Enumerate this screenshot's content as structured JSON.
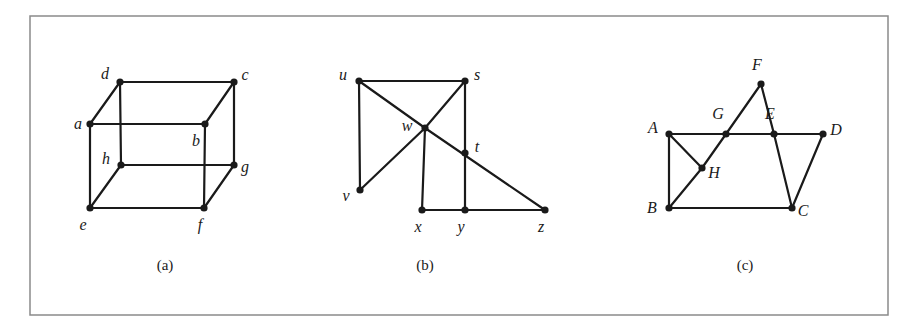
{
  "figure": {
    "background_color": "#ffffff",
    "border_color": "#8a8a8a",
    "edge_color": "#1a1a1a",
    "vertex_color": "#1a1a1a",
    "label_color": "#1a1a1a",
    "border": {
      "x": 30,
      "y": 16,
      "width": 858,
      "height": 299
    },
    "panels": [
      {
        "id": "a",
        "caption": "(a)",
        "caption_pos": {
          "x": 165,
          "y": 270
        },
        "vertices": [
          {
            "id": "a",
            "label": "a",
            "x": 90,
            "y": 124,
            "lx": 78,
            "ly": 129
          },
          {
            "id": "b",
            "label": "b",
            "x": 205,
            "y": 124,
            "lx": 196,
            "ly": 146
          },
          {
            "id": "c",
            "label": "c",
            "x": 234,
            "y": 82,
            "lx": 245,
            "ly": 80
          },
          {
            "id": "d",
            "label": "d",
            "x": 120,
            "y": 82,
            "lx": 105,
            "ly": 79
          },
          {
            "id": "e",
            "label": "e",
            "x": 90,
            "y": 208,
            "lx": 83,
            "ly": 230
          },
          {
            "id": "f",
            "label": "f",
            "x": 204,
            "y": 208,
            "lx": 200,
            "ly": 230
          },
          {
            "id": "g",
            "label": "g",
            "x": 234,
            "y": 165,
            "lx": 245,
            "ly": 172
          },
          {
            "id": "h",
            "label": "h",
            "x": 121,
            "y": 165,
            "lx": 106,
            "ly": 164
          }
        ],
        "edges": [
          [
            "d",
            "c"
          ],
          [
            "a",
            "b"
          ],
          [
            "h",
            "g"
          ],
          [
            "e",
            "f"
          ],
          [
            "a",
            "d"
          ],
          [
            "b",
            "c"
          ],
          [
            "e",
            "h"
          ],
          [
            "f",
            "g"
          ],
          [
            "d",
            "h"
          ],
          [
            "c",
            "g"
          ],
          [
            "a",
            "e"
          ],
          [
            "b",
            "f"
          ]
        ]
      },
      {
        "id": "b",
        "caption": "(b)",
        "caption_pos": {
          "x": 425,
          "y": 270
        },
        "vertices": [
          {
            "id": "u",
            "label": "u",
            "x": 359,
            "y": 81,
            "lx": 343,
            "ly": 80
          },
          {
            "id": "s",
            "label": "s",
            "x": 465,
            "y": 81,
            "lx": 477,
            "ly": 80
          },
          {
            "id": "w",
            "label": "w",
            "x": 425,
            "y": 128,
            "lx": 407,
            "ly": 131
          },
          {
            "id": "v",
            "label": "v",
            "x": 360,
            "y": 190,
            "lx": 346,
            "ly": 201
          },
          {
            "id": "t",
            "label": "t",
            "x": 465,
            "y": 153,
            "lx": 477,
            "ly": 152
          },
          {
            "id": "x",
            "label": "x",
            "x": 422,
            "y": 210,
            "lx": 418,
            "ly": 232
          },
          {
            "id": "y",
            "label": "y",
            "x": 465,
            "y": 210,
            "lx": 461,
            "ly": 232
          },
          {
            "id": "z",
            "label": "z",
            "x": 545,
            "y": 210,
            "lx": 541,
            "ly": 232
          }
        ],
        "edges": [
          [
            "u",
            "s"
          ],
          [
            "u",
            "v"
          ],
          [
            "u",
            "w"
          ],
          [
            "s",
            "w"
          ],
          [
            "s",
            "t"
          ],
          [
            "w",
            "v"
          ],
          [
            "w",
            "x"
          ],
          [
            "w",
            "z"
          ],
          [
            "t",
            "y"
          ],
          [
            "x",
            "y"
          ],
          [
            "y",
            "z"
          ]
        ]
      },
      {
        "id": "c",
        "caption": "(c)",
        "caption_pos": {
          "x": 745,
          "y": 270
        },
        "vertices": [
          {
            "id": "A",
            "label": "A",
            "x": 669,
            "y": 134,
            "lx": 653,
            "ly": 133
          },
          {
            "id": "B",
            "label": "B",
            "x": 669,
            "y": 208,
            "lx": 652,
            "ly": 213
          },
          {
            "id": "C",
            "label": "C",
            "x": 792,
            "y": 208,
            "lx": 803,
            "ly": 216
          },
          {
            "id": "D",
            "label": "D",
            "x": 823,
            "y": 134,
            "lx": 836,
            "ly": 135
          },
          {
            "id": "E",
            "label": "E",
            "x": 774,
            "y": 134,
            "lx": 770,
            "ly": 119
          },
          {
            "id": "F",
            "label": "F",
            "x": 761,
            "y": 84,
            "lx": 757,
            "ly": 70
          },
          {
            "id": "G",
            "label": "G",
            "x": 726,
            "y": 134,
            "lx": 718,
            "ly": 119
          },
          {
            "id": "H",
            "label": "H",
            "x": 702,
            "y": 168,
            "lx": 714,
            "ly": 178
          }
        ],
        "edges": [
          [
            "A",
            "G"
          ],
          [
            "G",
            "E"
          ],
          [
            "E",
            "D"
          ],
          [
            "A",
            "H"
          ],
          [
            "A",
            "B"
          ],
          [
            "B",
            "H"
          ],
          [
            "H",
            "G"
          ],
          [
            "G",
            "F"
          ],
          [
            "F",
            "E"
          ],
          [
            "E",
            "C"
          ],
          [
            "B",
            "C"
          ],
          [
            "C",
            "D"
          ]
        ]
      }
    ]
  }
}
